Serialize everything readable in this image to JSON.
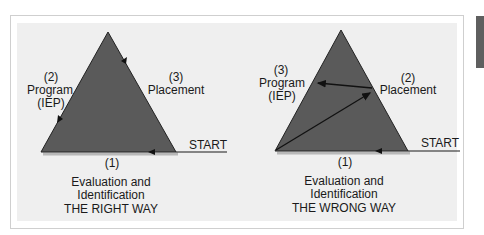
{
  "diagrams": [
    {
      "id": "right",
      "caption": "THE RIGHT WAY",
      "step1": {
        "num": "(1)",
        "line1": "Evaluation and",
        "line2": "Identification"
      },
      "left_side": {
        "num": "(2)",
        "line1": "Program",
        "line2": "(IEP)"
      },
      "right_side": {
        "num": "(3)",
        "line1": "Placement"
      },
      "start": "START"
    },
    {
      "id": "wrong",
      "caption": "THE WRONG WAY",
      "step1": {
        "num": "(1)",
        "line1": "Evaluation and",
        "line2": "Identification"
      },
      "left_side": {
        "num": "(3)",
        "line1": "Program",
        "line2": "(IEP)"
      },
      "right_side": {
        "num": "(2)",
        "line1": "Placement"
      },
      "start": "START"
    }
  ],
  "colors": {
    "triangle": "#5a5a5a",
    "panel": "#efefef",
    "shadow": "#b8b8b8",
    "line": "#1a1a1a"
  }
}
